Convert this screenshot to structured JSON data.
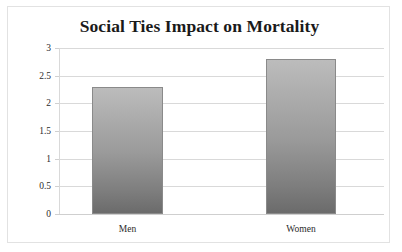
{
  "chart_data": {
    "type": "bar",
    "title": "Social Ties Impact on Mortality",
    "categories": [
      "Men",
      "Women"
    ],
    "values": [
      2.3,
      2.8
    ],
    "xlabel": "",
    "ylabel": "",
    "ylim": [
      0,
      3
    ],
    "ytick_labels": [
      "3",
      "2.5",
      "2",
      "1.5",
      "1",
      "0.5",
      "0"
    ],
    "ytick_values": [
      3,
      2.5,
      2,
      1.5,
      1,
      0.5,
      0
    ],
    "grid": true,
    "legend": false,
    "series": [
      {
        "name": "Relative mortality risk",
        "values": [
          2.3,
          2.8
        ]
      }
    ],
    "colors": {
      "bar_top": "#bcbcbc",
      "bar_bottom": "#6b6b6b",
      "bar_border": "#8a8a8a",
      "gridline": "#d9d9d9",
      "frame_border": "#e2e2e2",
      "title_text": "#1a1a1a",
      "axis_text": "#2b2b2b",
      "plot_background": "#ffffff"
    }
  }
}
